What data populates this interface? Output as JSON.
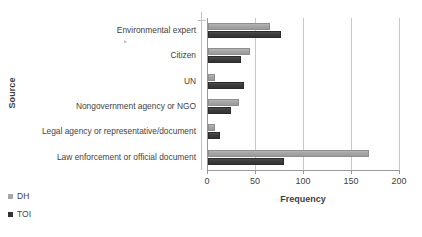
{
  "chart_data": {
    "type": "bar",
    "orientation": "horizontal",
    "title": "",
    "xlabel": "Frequency",
    "ylabel": "Source",
    "xlim": [
      0,
      200
    ],
    "xticks": [
      0,
      50,
      100,
      150,
      200
    ],
    "grid": true,
    "legend_position": "bottom-left",
    "categories": [
      "Environmental  expert",
      "Citizen",
      "UN",
      "Nongovernment agency or NGO",
      "Legal agency or representative/document",
      "Law enforcement or official document"
    ],
    "series": [
      {
        "name": "DH",
        "color": "#a8a8a8",
        "values": [
          65,
          44,
          7,
          32,
          7,
          168
        ]
      },
      {
        "name": "TOI",
        "color": "#333333",
        "values": [
          76,
          34,
          37,
          24,
          12,
          79
        ]
      }
    ]
  },
  "legend": {
    "items": [
      {
        "label": "DH",
        "swatch": "dh-swatch-icon"
      },
      {
        "label": "TOI",
        "swatch": "toi-swatch-icon"
      }
    ]
  },
  "axes": {
    "x_title": "Frequency",
    "y_title": "Source",
    "x_tick_labels": [
      "0",
      "50",
      "100",
      "150",
      "200"
    ]
  },
  "artifacts": {
    "stray_mark": "ь"
  }
}
